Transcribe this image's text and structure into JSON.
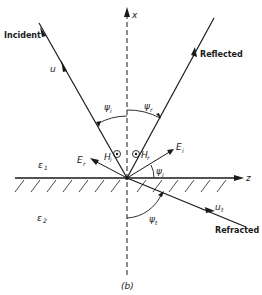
{
  "figure": {
    "caption": "(b)",
    "axes": {
      "vertical_label": "x",
      "horizontal_label": "z"
    },
    "media": {
      "upper": {
        "symbol": "ε",
        "sub": "1"
      },
      "lower": {
        "symbol": "ε",
        "sub": "2"
      }
    },
    "rays": {
      "incident": {
        "label": "Incident",
        "vector": "u",
        "vector_sub": ""
      },
      "reflected": {
        "label": "Reflected"
      },
      "refracted": {
        "label": "Refracted",
        "vector": "u",
        "vector_sub": "t"
      }
    },
    "angles": {
      "incident": {
        "symbol": "ψ",
        "sub": "i"
      },
      "reflected": {
        "symbol": "ψ",
        "sub": "r"
      },
      "transmitted": {
        "symbol": "ψ",
        "sub": "t"
      },
      "field_angle": {
        "symbol": "ψ",
        "sub": "i"
      }
    },
    "fields": {
      "E_r": {
        "symbol": "E",
        "sub": "r"
      },
      "E_i": {
        "symbol": "E",
        "sub": "i"
      },
      "H_i": {
        "symbol": "H",
        "sub": "i"
      },
      "H_r": {
        "symbol": "H",
        "sub": "r"
      }
    },
    "colors": {
      "ink": "#1a1a1a",
      "background": "#ffffff"
    }
  }
}
